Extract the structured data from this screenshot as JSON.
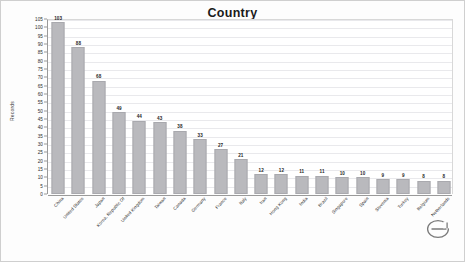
{
  "chart_data": {
    "type": "bar",
    "title": "Country",
    "xlabel": "",
    "ylabel": "Records",
    "ylim": [
      0,
      105
    ],
    "ytick_step": 5,
    "grid": true,
    "legend": "none",
    "orientation": "vertical",
    "bar_color": "#b9b9bd",
    "categories": [
      "China",
      "United States",
      "Japan",
      "Korea, Republic Of",
      "United Kingdom",
      "Taiwan",
      "Canada",
      "Germany",
      "France",
      "Italy",
      "Iran",
      "Hong Kong",
      "India",
      "Brazil",
      "Singapore",
      "Spain",
      "Slovenia",
      "Turkey",
      "Belgium",
      "Netherlands"
    ],
    "values": [
      103,
      88,
      68,
      49,
      44,
      43,
      38,
      33,
      27,
      21,
      12,
      12,
      11,
      11,
      10,
      10,
      9,
      9,
      8,
      8
    ],
    "yticks": [
      0,
      5,
      10,
      15,
      20,
      25,
      30,
      35,
      40,
      45,
      50,
      55,
      60,
      65,
      70,
      75,
      80,
      85,
      90,
      95,
      100,
      105
    ]
  },
  "watermark": {
    "name": "elsevier-e-logo",
    "color": "#6f6f6f"
  }
}
